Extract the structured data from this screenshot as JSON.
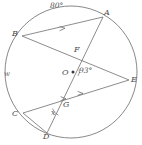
{
  "figure": {
    "kind": "circle-geometry-diagram",
    "stroke_color": "#6e6e6e",
    "label_color": "#4a4a4a",
    "background": "#ffffff",
    "circle": {
      "cx": 71,
      "cy": 72,
      "r": 66,
      "name_label": "w"
    }
  },
  "points": [
    {
      "id": "A",
      "label": "A",
      "x": 103,
      "y": 17,
      "label_x": 104,
      "label_y": 10
    },
    {
      "id": "B",
      "label": "B",
      "x": 22,
      "y": 36,
      "label_x": 13,
      "label_y": 31
    },
    {
      "id": "C",
      "label": "C",
      "x": 23,
      "y": 113,
      "label_x": 13,
      "label_y": 112
    },
    {
      "id": "D",
      "label": "D",
      "x": 47,
      "y": 133,
      "label_x": 43,
      "label_y": 134
    },
    {
      "id": "E",
      "label": "E",
      "x": 129,
      "y": 80,
      "label_x": 132,
      "label_y": 78
    },
    {
      "id": "O",
      "label": "O",
      "x": 73,
      "y": 72,
      "label_x": 63,
      "label_y": 71
    },
    {
      "id": "F",
      "label": "F",
      "x": 76,
      "y": 55,
      "label_x": 75,
      "label_y": 48
    },
    {
      "id": "G",
      "label": "G",
      "x": 62,
      "y": 107,
      "label_x": 63,
      "label_y": 104
    }
  ],
  "chords": [
    {
      "id": "BA",
      "from": "B",
      "to": "A",
      "ticks": 1
    },
    {
      "id": "BE",
      "from": "B",
      "to": "E",
      "ticks": 0
    },
    {
      "id": "AD",
      "from": "A",
      "to": "D",
      "ticks": 0
    },
    {
      "id": "CE",
      "from": "C",
      "to": "E",
      "ticks": 2
    },
    {
      "id": "CD",
      "from": "C",
      "to": "D",
      "ticks": 0
    }
  ],
  "annotations": [
    {
      "id": "arc-80",
      "text": "80°",
      "x": 50,
      "y": 3,
      "class": "lbl-deg"
    },
    {
      "id": "angle-93",
      "text": "93°",
      "x": 79,
      "y": 68,
      "class": "lbl-deg"
    },
    {
      "id": "circle-name-w",
      "text": "w",
      "x": 4,
      "y": 72,
      "class": "lbl-w"
    },
    {
      "id": "angle-x",
      "text": "x",
      "x": 51,
      "y": 110,
      "class": "lbl-x"
    }
  ],
  "angle_arcs": [
    {
      "id": "arc-at-O",
      "at": "O"
    },
    {
      "id": "arc-at-G",
      "at": "G"
    }
  ]
}
